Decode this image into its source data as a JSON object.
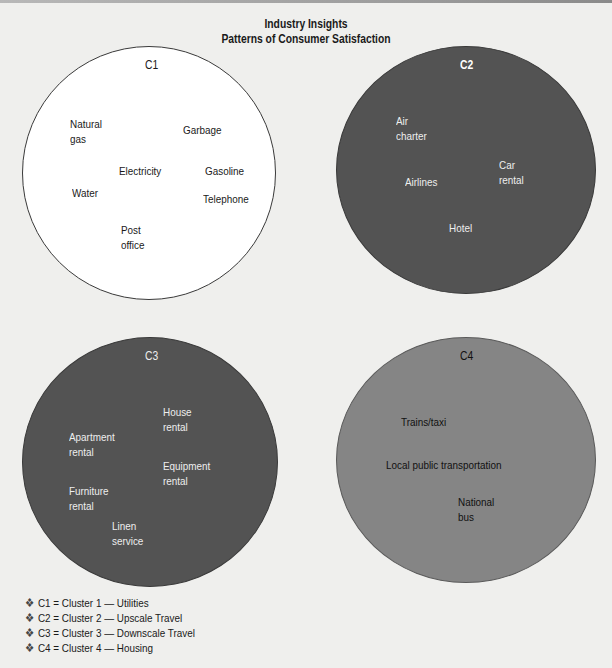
{
  "header": {
    "title": "Industry Insights",
    "subtitle": "Patterns of Consumer Satisfaction"
  },
  "colors": {
    "background": "#efefed",
    "c1_fill": "#ffffff",
    "c2_fill": "#535353",
    "c3_fill": "#535353",
    "c4_fill": "#858585"
  },
  "clusters": [
    {
      "id": "C1",
      "name": "Utilities",
      "items": [
        {
          "line1": "Natural",
          "line2": "gas"
        },
        {
          "line1": "Garbage"
        },
        {
          "line1": "Electricity"
        },
        {
          "line1": "Gasoline"
        },
        {
          "line1": "Water"
        },
        {
          "line1": "Telephone"
        },
        {
          "line1": "Post",
          "line2": "office"
        }
      ]
    },
    {
      "id": "C2",
      "name": "Upscale Travel",
      "items": [
        {
          "line1": "Air",
          "line2": "charter"
        },
        {
          "line1": "Car",
          "line2": "rental"
        },
        {
          "line1": "Airlines"
        },
        {
          "line1": "Hotel"
        }
      ]
    },
    {
      "id": "C3",
      "name": "Downscale Travel",
      "items": [
        {
          "line1": "House",
          "line2": "rental"
        },
        {
          "line1": "Apartment",
          "line2": "rental"
        },
        {
          "line1": "Equipment",
          "line2": "rental"
        },
        {
          "line1": "Furniture",
          "line2": "rental"
        },
        {
          "line1": "Linen",
          "line2": "service"
        }
      ]
    },
    {
      "id": "C4",
      "name": "Housing",
      "items": [
        {
          "line1": "Trains/taxi"
        },
        {
          "line1": "Local public transportation"
        },
        {
          "line1": "National",
          "line2": "bus"
        }
      ]
    }
  ],
  "legend": {
    "bullet": "❖",
    "rows": [
      "C1 = Cluster 1 — Utilities",
      "C2 = Cluster 2 — Upscale Travel",
      "C3 = Cluster 3 — Downscale Travel",
      "C4 = Cluster 4 — Housing"
    ]
  }
}
